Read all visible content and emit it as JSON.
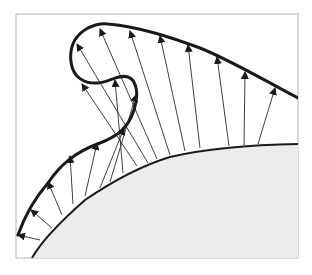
{
  "diagram": {
    "title": "",
    "colors": {
      "background": "#ffffff",
      "frame": "#b4b4b4",
      "body_fill": "#ececec",
      "curve": "#1a1a1a",
      "arrow": "#2a2a2a"
    },
    "frame": {
      "x": 16,
      "y": 14,
      "width": 282,
      "height": 244
    },
    "body_curve": "M32,258 C42,240 60,222 85,200 C110,183 140,166 170,157 C200,150 240,145 298,144",
    "outer_curve": "M18,235 C25,215 35,198 48,183 C60,165 75,152 100,143 C118,136 128,128 134,110 C139,95 137,80 128,77 C118,74 110,82 98,83 C85,84 73,78 71,62 C69,45 77,34 88,28 C95,25 100,23 108,24 C140,27 170,37 200,48 C230,60 260,78 298,98",
    "arrows": [
      {
        "x1": 40,
        "y1": 240,
        "x2": 18,
        "y2": 235
      },
      {
        "x1": 52,
        "y1": 228,
        "x2": 31,
        "y2": 210
      },
      {
        "x1": 62,
        "y1": 215,
        "x2": 48,
        "y2": 182
      },
      {
        "x1": 73,
        "y1": 204,
        "x2": 70,
        "y2": 156
      },
      {
        "x1": 85,
        "y1": 196,
        "x2": 97,
        "y2": 143
      },
      {
        "x1": 100,
        "y1": 188,
        "x2": 124,
        "y2": 128
      },
      {
        "x1": 110,
        "y1": 182,
        "x2": 136,
        "y2": 95
      },
      {
        "x1": 123,
        "y1": 173,
        "x2": 115,
        "y2": 80
      },
      {
        "x1": 137,
        "y1": 166,
        "x2": 82,
        "y2": 84
      },
      {
        "x1": 148,
        "y1": 163,
        "x2": 77,
        "y2": 44
      },
      {
        "x1": 157,
        "y1": 159,
        "x2": 100,
        "y2": 29
      },
      {
        "x1": 170,
        "y1": 155,
        "x2": 130,
        "y2": 31
      },
      {
        "x1": 185,
        "y1": 151,
        "x2": 160,
        "y2": 36
      },
      {
        "x1": 200,
        "y1": 148,
        "x2": 188,
        "y2": 45
      },
      {
        "x1": 229,
        "y1": 146,
        "x2": 217,
        "y2": 57
      },
      {
        "x1": 244,
        "y1": 145,
        "x2": 245,
        "y2": 72
      },
      {
        "x1": 258,
        "y1": 144,
        "x2": 275,
        "y2": 88
      }
    ]
  }
}
